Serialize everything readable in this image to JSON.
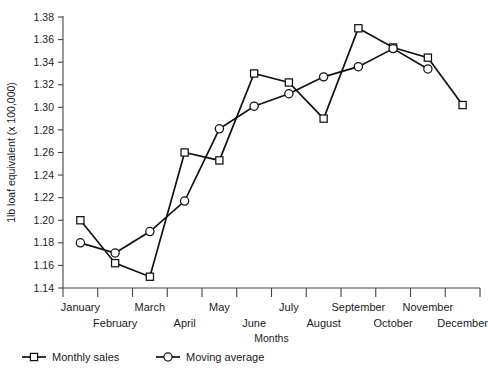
{
  "chart_data": {
    "type": "line",
    "title": "",
    "xlabel": "Months",
    "ylabel": "1lb loaf equivalent (x 100,000)",
    "categories": [
      "January",
      "February",
      "March",
      "April",
      "May",
      "June",
      "July",
      "August",
      "September",
      "October",
      "November",
      "December"
    ],
    "ylim": [
      1.14,
      1.38
    ],
    "ytick_labels": [
      "1.14",
      "1.16",
      "1.18",
      "1.20",
      "1.22",
      "1.24",
      "1.26",
      "1.28",
      "1.30",
      "1.32",
      "1.34",
      "1.36",
      "1.38"
    ],
    "ytick_values": [
      1.14,
      1.16,
      1.18,
      1.2,
      1.22,
      1.24,
      1.26,
      1.28,
      1.3,
      1.32,
      1.34,
      1.36,
      1.38
    ],
    "grid": false,
    "legend_position": "below-left",
    "series": [
      {
        "name": "Monthly sales",
        "marker": "square",
        "values": [
          1.2,
          1.162,
          1.15,
          1.26,
          1.253,
          1.33,
          1.322,
          1.29,
          1.37,
          1.353,
          1.344,
          1.302
        ]
      },
      {
        "name": "Moving average",
        "marker": "circle",
        "values": [
          1.18,
          1.171,
          1.19,
          1.217,
          1.281,
          1.301,
          1.312,
          1.327,
          1.336,
          1.352,
          1.334,
          null
        ]
      }
    ]
  },
  "legend": {
    "items": [
      {
        "label": "Monthly sales",
        "marker": "square"
      },
      {
        "label": "Moving average",
        "marker": "circle"
      }
    ]
  },
  "colors": {
    "line": "#111111",
    "axis": "#444444",
    "marker_fill": "#ffffff",
    "background": "#ffffff"
  }
}
